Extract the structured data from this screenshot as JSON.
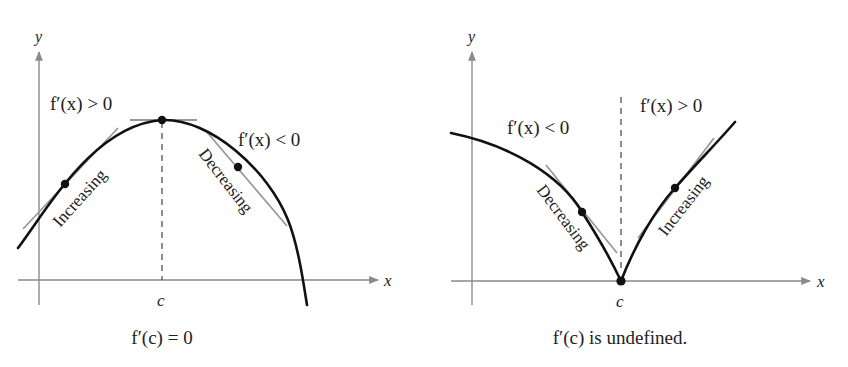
{
  "left_graph": {
    "axis_x_label": "x",
    "axis_y_label": "y",
    "tick_label": "c",
    "left_condition": "f′(x) > 0",
    "right_condition": "f′(x) < 0",
    "increasing_label": "Increasing",
    "decreasing_label": "Decreasing",
    "caption": "f′(c) = 0"
  },
  "right_graph": {
    "axis_x_label": "x",
    "axis_y_label": "y",
    "tick_label": "c",
    "left_condition": "f′(x) < 0",
    "right_condition": "f′(x) > 0",
    "decreasing_label": "Decreasing",
    "increasing_label": "Increasing",
    "caption": "f′(c) is undefined."
  },
  "colors": {
    "curve": "#111111",
    "axis": "#8a8a8a",
    "tangent": "#9a9a9a"
  }
}
